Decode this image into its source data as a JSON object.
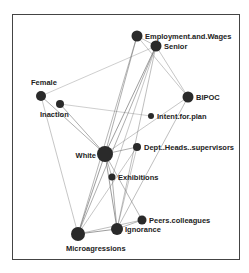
{
  "diagram": {
    "type": "network-graph",
    "nodes": [
      {
        "id": "emp",
        "label": "Employment.and.Wages",
        "x": 137,
        "y": 36,
        "r": 5.5,
        "lx": 145,
        "ly": 39,
        "anchor": "start"
      },
      {
        "id": "senior",
        "label": "Senior",
        "x": 156,
        "y": 46,
        "r": 5.5,
        "lx": 164,
        "ly": 49,
        "anchor": "start"
      },
      {
        "id": "female",
        "label": "Female",
        "x": 41,
        "y": 96,
        "r": 5,
        "lx": 31,
        "ly": 85,
        "anchor": "start"
      },
      {
        "id": "inaction",
        "label": "Inaction",
        "x": 60,
        "y": 104,
        "r": 4,
        "lx": 40,
        "ly": 117,
        "anchor": "start"
      },
      {
        "id": "bipoc",
        "label": "BIPOC",
        "x": 188,
        "y": 97,
        "r": 5.5,
        "lx": 196,
        "ly": 100,
        "anchor": "start"
      },
      {
        "id": "intent",
        "label": "Intent.for.plan",
        "x": 151,
        "y": 116,
        "r": 3,
        "lx": 157,
        "ly": 119,
        "anchor": "start"
      },
      {
        "id": "white",
        "label": "White",
        "x": 105,
        "y": 154,
        "r": 8,
        "lx": 96,
        "ly": 158,
        "anchor": "end"
      },
      {
        "id": "dept",
        "label": "Dept..Heads..supervisors",
        "x": 137,
        "y": 147,
        "r": 4,
        "lx": 144,
        "ly": 150,
        "anchor": "start"
      },
      {
        "id": "exhib",
        "label": "Exhibitions",
        "x": 112,
        "y": 177,
        "r": 3.5,
        "lx": 118,
        "ly": 180,
        "anchor": "start"
      },
      {
        "id": "peers",
        "label": "Peers.colleagues",
        "x": 142,
        "y": 220,
        "r": 4.5,
        "lx": 149,
        "ly": 223,
        "anchor": "start"
      },
      {
        "id": "ignorance",
        "label": "Ignorance",
        "x": 117,
        "y": 229,
        "r": 6,
        "lx": 125,
        "ly": 232,
        "anchor": "start"
      },
      {
        "id": "micro",
        "label": "Microagressions",
        "x": 78,
        "y": 234,
        "r": 7,
        "lx": 66,
        "ly": 251,
        "anchor": "start"
      }
    ],
    "edges": [
      [
        "female",
        "senior",
        0.6
      ],
      [
        "female",
        "white",
        1.0
      ],
      [
        "female",
        "micro",
        0.7
      ],
      [
        "inaction",
        "intent",
        0.6
      ],
      [
        "inaction",
        "white",
        1.0
      ],
      [
        "emp",
        "white",
        1.0
      ],
      [
        "emp",
        "micro",
        0.9
      ],
      [
        "emp",
        "bipoc",
        0.7
      ],
      [
        "emp",
        "senior",
        0.8
      ],
      [
        "senior",
        "white",
        1.2
      ],
      [
        "senior",
        "micro",
        1.0
      ],
      [
        "senior",
        "ignorance",
        0.8
      ],
      [
        "senior",
        "bipoc",
        0.7
      ],
      [
        "senior",
        "exhib",
        0.7
      ],
      [
        "bipoc",
        "white",
        0.7
      ],
      [
        "bipoc",
        "ignorance",
        0.8
      ],
      [
        "white",
        "dept",
        1.0
      ],
      [
        "white",
        "micro",
        1.2
      ],
      [
        "white",
        "ignorance",
        1.2
      ],
      [
        "white",
        "peers",
        0.9
      ],
      [
        "white",
        "exhib",
        0.9
      ],
      [
        "dept",
        "micro",
        0.7
      ],
      [
        "dept",
        "ignorance",
        0.7
      ],
      [
        "exhib",
        "ignorance",
        1.0
      ],
      [
        "micro",
        "ignorance",
        1.2
      ],
      [
        "micro",
        "peers",
        0.8
      ],
      [
        "ignorance",
        "peers",
        0.9
      ]
    ]
  }
}
